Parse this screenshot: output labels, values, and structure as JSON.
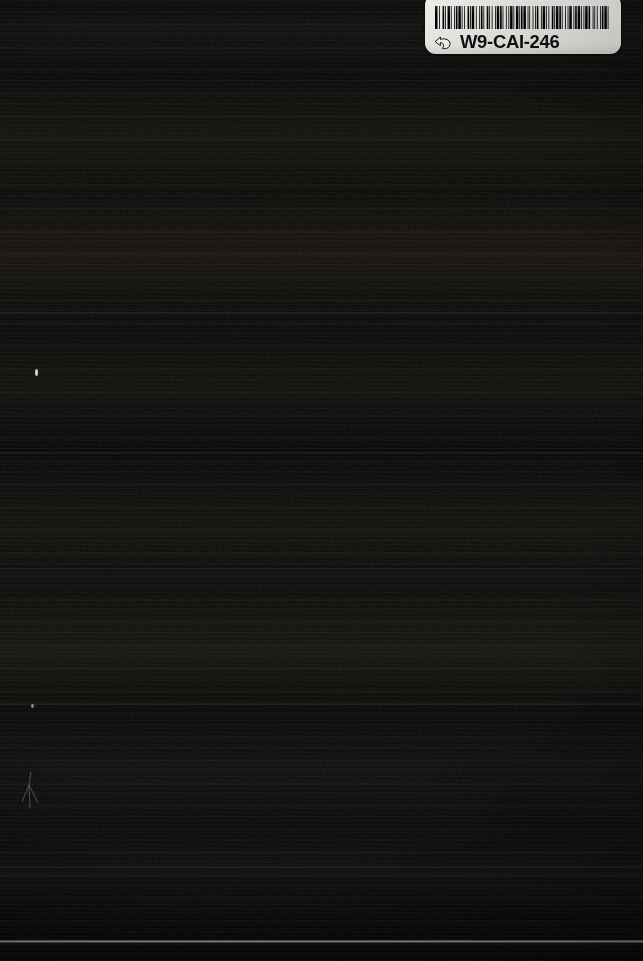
{
  "photo": {
    "subject": "dark book cover",
    "width": 643,
    "height": 961,
    "background_color": "#0d0c0b",
    "surface_description": "near-black cover with horizontal scan banding"
  },
  "label": {
    "name": "library barcode sticker",
    "code": "W9-CAI-246",
    "background_color": "#f4f3ef",
    "text_color": "#111111",
    "icon": "pointing-hand-icon",
    "barcode": {
      "type": "code-39",
      "bar_color": "#000000",
      "pattern": [
        3,
        2,
        1,
        3,
        2,
        1,
        1,
        2,
        3,
        1,
        1,
        3,
        1,
        1,
        2,
        1,
        3,
        1,
        1,
        2,
        1,
        3,
        2,
        1,
        1,
        1,
        3,
        2,
        1,
        3,
        1,
        1,
        2,
        1,
        1,
        3,
        2,
        1,
        1,
        2,
        1,
        3,
        1,
        1,
        3,
        1,
        2,
        1,
        1,
        3,
        1,
        2,
        1,
        1,
        3,
        1,
        1,
        2,
        3,
        1,
        1,
        1,
        2,
        1,
        3,
        2,
        1,
        1,
        1,
        3,
        1,
        2,
        1,
        1,
        2,
        3,
        1,
        1,
        3,
        1,
        1,
        2,
        1,
        3,
        2,
        1,
        1,
        1,
        3,
        1,
        2,
        1,
        1,
        3,
        1,
        2,
        1,
        1,
        3,
        2,
        1,
        1,
        2,
        1,
        3,
        1,
        1,
        2,
        1,
        1,
        3,
        1,
        2,
        3,
        1,
        1,
        1,
        2,
        1,
        3,
        1,
        1,
        2,
        1,
        3,
        1,
        1,
        3
      ]
    }
  },
  "artifacts": {
    "bright_speck_label": "dust speck",
    "scratch_label": "surface scratch",
    "bright_line_label": "horizontal light streak"
  }
}
